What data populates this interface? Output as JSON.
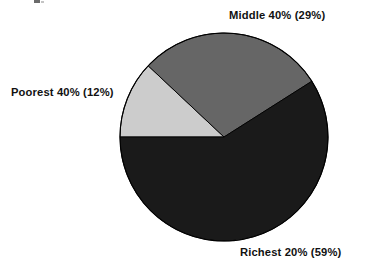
{
  "chart_data": {
    "type": "pie",
    "title": "",
    "subtitle": "",
    "xlabel": "",
    "ylabel": "",
    "legend_position": "none",
    "grid": false,
    "labels_outside": true,
    "categories": [
      "Poorest 40%",
      "Middle 40%",
      "Richest 20%"
    ],
    "values": [
      12,
      29,
      59
    ],
    "value_unit": "%",
    "slices": [
      {
        "name": "Poorest 40%",
        "group_label": "Poorest 40%",
        "value": 12,
        "value_text": "(12%)",
        "label": "Poorest 40% (12%)",
        "color": "#cccccc",
        "start_angle_deg": 180,
        "end_angle_deg": 223.2
      },
      {
        "name": "Middle 40%",
        "group_label": "Middle 40%",
        "value": 29,
        "value_text": "(29%)",
        "label": "Middle 40% (29%)",
        "color": "#666666",
        "start_angle_deg": 223.2,
        "end_angle_deg": 327.6
      },
      {
        "name": "Richest 20%",
        "group_label": "Richest 20%",
        "value": 59,
        "value_text": "(59%)",
        "label": "Richest 20% (59%)",
        "color": "#1a1a1a",
        "start_angle_deg": 327.6,
        "end_angle_deg": 540
      }
    ],
    "total": 100,
    "background_color": "#ffffff",
    "outline_color": "#000000"
  },
  "figure": {
    "background": "#ffffff",
    "center_x": 224,
    "center_y": 137,
    "radius": 104
  },
  "labels": {
    "middle": "Middle 40% (29%)",
    "poorest": "Poorest 40% (12%)",
    "richest": "Richest 20% (59%)"
  }
}
